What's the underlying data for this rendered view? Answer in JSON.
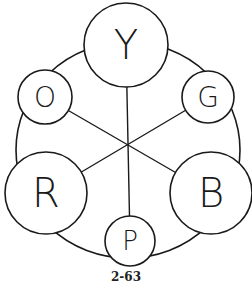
{
  "figure": {
    "caption": "2-63",
    "stroke_color": "#1a1a1a",
    "background": "#ffffff"
  },
  "diagram": {
    "center": {
      "x": 128,
      "y": 144
    },
    "ring": {
      "cx": 128,
      "cy": 150,
      "rx": 112,
      "ry": 108
    },
    "nodes": [
      {
        "id": "Y",
        "label": "Y",
        "cx": 126,
        "cy": 45,
        "r": 42,
        "font_size": 40
      },
      {
        "id": "G",
        "label": "G",
        "cx": 208,
        "cy": 97,
        "r": 26,
        "font_size": 28
      },
      {
        "id": "B",
        "label": "B",
        "cx": 211,
        "cy": 193,
        "r": 41,
        "font_size": 40
      },
      {
        "id": "P",
        "label": "P",
        "cx": 130,
        "cy": 241,
        "r": 25,
        "font_size": 26
      },
      {
        "id": "R",
        "label": "R",
        "cx": 46,
        "cy": 193,
        "r": 41,
        "font_size": 40
      },
      {
        "id": "O",
        "label": "O",
        "cx": 45,
        "cy": 97,
        "r": 27,
        "font_size": 28
      }
    ],
    "spokes": [
      {
        "from": "Y",
        "to": "P"
      },
      {
        "from": "O",
        "to": "B"
      },
      {
        "from": "G",
        "to": "R"
      }
    ]
  }
}
